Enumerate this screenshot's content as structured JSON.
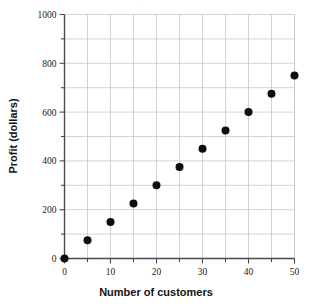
{
  "chart_data": {
    "type": "scatter",
    "title": "",
    "xlabel": "Number of customers",
    "ylabel": "Profit (dollars)",
    "xlim": [
      0,
      50
    ],
    "ylim": [
      0,
      1000
    ],
    "grid": true,
    "legend": "none",
    "x_major_ticks": [
      0,
      10,
      20,
      30,
      40,
      50
    ],
    "x_minor_ticks": [
      5,
      15,
      25,
      35,
      45
    ],
    "y_major_ticks": [
      0,
      200,
      400,
      600,
      800,
      1000
    ],
    "y_minor_ticks": [
      100,
      300,
      500,
      700,
      900
    ],
    "x_tick_labels": [
      "0",
      "10",
      "20",
      "30",
      "40",
      "50"
    ],
    "y_tick_labels": [
      "0",
      "200",
      "400",
      "600",
      "800",
      "1000"
    ],
    "marker": "filled-circle",
    "marker_color": "#0d0d0d",
    "marker_size": 8,
    "grid_color": "#c8c8c8",
    "axis_color": "#4a4a4a",
    "x": [
      0,
      5,
      10,
      15,
      20,
      25,
      30,
      35,
      40,
      45,
      50
    ],
    "values": [
      0,
      75,
      150,
      225,
      300,
      375,
      450,
      525,
      600,
      675,
      750
    ],
    "points": [
      {
        "x": 0,
        "y": 0
      },
      {
        "x": 5,
        "y": 75
      },
      {
        "x": 10,
        "y": 150
      },
      {
        "x": 15,
        "y": 225
      },
      {
        "x": 20,
        "y": 300
      },
      {
        "x": 25,
        "y": 375
      },
      {
        "x": 30,
        "y": 450
      },
      {
        "x": 35,
        "y": 525
      },
      {
        "x": 40,
        "y": 600
      },
      {
        "x": 45,
        "y": 675
      },
      {
        "x": 50,
        "y": 750
      }
    ]
  },
  "figure": {
    "title_clipped": "Profit per Customer"
  }
}
